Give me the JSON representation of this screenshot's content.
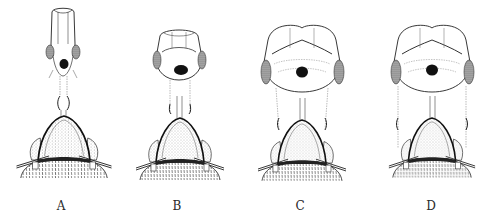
{
  "figure": {
    "panels": [
      {
        "id": "A",
        "label": "A",
        "center_x": 63,
        "head": {
          "top": 8,
          "bottom": 78,
          "half_width": 16
        },
        "neck": {
          "top": 78,
          "bottom": 116
        }
      },
      {
        "id": "B",
        "label": "B",
        "center_x": 179,
        "head": {
          "top": 28,
          "bottom": 80,
          "half_width": 25
        },
        "neck": {
          "top": 80,
          "bottom": 118
        }
      },
      {
        "id": "C",
        "label": "C",
        "center_x": 302,
        "head": {
          "top": 22,
          "bottom": 90,
          "half_width": 40
        },
        "neck": {
          "top": 90,
          "bottom": 122
        }
      },
      {
        "id": "D",
        "label": "D",
        "center_x": 432,
        "head": {
          "top": 22,
          "bottom": 90,
          "half_width": 40
        },
        "neck": {
          "top": 90,
          "bottom": 122
        }
      }
    ],
    "colors": {
      "ink": "#1a1a1a",
      "stipple": "#8a8a8a",
      "background": "#ffffff"
    }
  }
}
